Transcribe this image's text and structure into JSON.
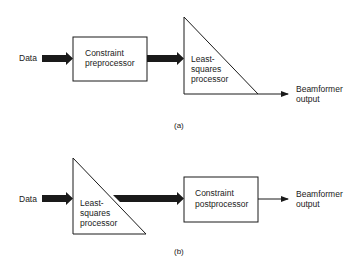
{
  "diagram": {
    "a": {
      "caption": "(a)",
      "input_label": "Data",
      "block1": {
        "line1": "Constraint",
        "line2": "preprocessor"
      },
      "block2": {
        "line1": "Least-",
        "line2": "squares",
        "line3": "processor"
      },
      "output": {
        "line1": "Beamformer",
        "line2": "output"
      }
    },
    "b": {
      "caption": "(b)",
      "input_label": "Data",
      "block1": {
        "line1": "Least-",
        "line2": "squares",
        "line3": "processor"
      },
      "block2": {
        "line1": "Constraint",
        "line2": "postprocessor"
      },
      "output": {
        "line1": "Beamformer",
        "line2": "output"
      }
    },
    "colors": {
      "stroke": "#1a1a1a",
      "background": "#ffffff"
    }
  }
}
